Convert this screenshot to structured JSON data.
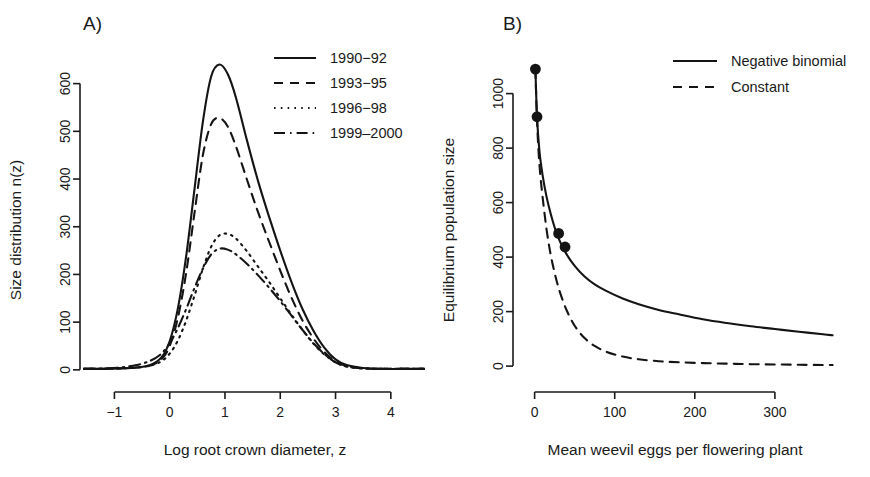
{
  "figure": {
    "background": "#ffffff",
    "line_color": "#141414",
    "panels": [
      "A)",
      "B)"
    ]
  },
  "panel_a": {
    "tag": "A)",
    "legend": {
      "position": "top-right",
      "entries": [
        {
          "label": "1990−92",
          "style": "solid"
        },
        {
          "label": "1993−95",
          "style": "dashed"
        },
        {
          "label": "1996−98",
          "style": "dotted"
        },
        {
          "label": "1999–2000",
          "style": "dashdot"
        }
      ]
    }
  },
  "panel_b": {
    "tag": "B)",
    "legend": {
      "position": "top-right",
      "entries": [
        {
          "label": "Negative binomial",
          "style": "solid"
        },
        {
          "label": "Constant",
          "style": "dashed"
        }
      ]
    }
  },
  "chart_data": [
    {
      "type": "line",
      "panel": "A)",
      "title": "",
      "xlabel": "Log root crown diameter, z",
      "ylabel": "Size distribution n(z)",
      "xlim": [
        -1.55,
        4.6
      ],
      "ylim": [
        -15,
        660
      ],
      "xticks": [
        -1,
        0,
        1,
        2,
        3,
        4
      ],
      "xticklabels": [
        "−1",
        "0",
        "1",
        "2",
        "3",
        "4"
      ],
      "yticks": [
        0,
        100,
        200,
        300,
        400,
        500,
        600
      ],
      "yticklabels": [
        "0",
        "100",
        "200",
        "300",
        "400",
        "500",
        "600"
      ],
      "grid": false,
      "legend_position": "upper right",
      "series": [
        {
          "name": "1990−92",
          "style": "solid",
          "peak_x": 0.9,
          "peak_y": 640,
          "x": [
            -1.55,
            -1.2,
            -0.9,
            -0.6,
            -0.35,
            -0.15,
            0.0,
            0.15,
            0.3,
            0.45,
            0.6,
            0.75,
            0.9,
            1.05,
            1.2,
            1.4,
            1.6,
            1.8,
            2.0,
            2.2,
            2.4,
            2.6,
            2.8,
            3.0,
            3.2,
            3.5,
            3.9,
            4.3,
            4.6
          ],
          "y": [
            2,
            2,
            3,
            5,
            10,
            26,
            60,
            130,
            240,
            380,
            520,
            615,
            640,
            620,
            570,
            480,
            395,
            320,
            250,
            185,
            128,
            82,
            46,
            22,
            10,
            4,
            2,
            2,
            2
          ]
        },
        {
          "name": "1993−95",
          "style": "dashed",
          "peak_x": 0.95,
          "peak_y": 528,
          "x": [
            -1.55,
            -1.2,
            -0.9,
            -0.6,
            -0.35,
            -0.15,
            0.0,
            0.15,
            0.3,
            0.45,
            0.6,
            0.75,
            0.9,
            1.05,
            1.2,
            1.4,
            1.6,
            1.8,
            2.0,
            2.2,
            2.4,
            2.6,
            2.8,
            3.0,
            3.2,
            3.5,
            3.9,
            4.3,
            4.6
          ],
          "y": [
            2,
            2,
            3,
            5,
            9,
            22,
            50,
            110,
            205,
            330,
            450,
            515,
            528,
            510,
            468,
            398,
            330,
            268,
            208,
            152,
            104,
            66,
            37,
            18,
            8,
            3,
            2,
            2,
            2
          ]
        },
        {
          "name": "1996−98",
          "style": "dotted",
          "peak_x": 1.0,
          "peak_y": 285,
          "x": [
            -1.55,
            -1.2,
            -0.9,
            -0.6,
            -0.35,
            -0.15,
            0.0,
            0.15,
            0.3,
            0.45,
            0.6,
            0.75,
            0.9,
            1.05,
            1.2,
            1.4,
            1.6,
            1.8,
            2.0,
            2.2,
            2.4,
            2.6,
            2.8,
            3.0,
            3.2,
            3.5,
            3.9,
            4.3,
            4.6
          ],
          "y": [
            2,
            2,
            3,
            5,
            9,
            18,
            34,
            62,
            104,
            156,
            212,
            258,
            282,
            285,
            275,
            248,
            216,
            184,
            150,
            116,
            84,
            55,
            32,
            16,
            7,
            3,
            2,
            2,
            2
          ]
        },
        {
          "name": "1999–2000",
          "style": "dashdot",
          "peak_x": 0.95,
          "peak_y": 255,
          "x": [
            -1.55,
            -1.2,
            -0.9,
            -0.6,
            -0.35,
            -0.15,
            0.0,
            0.15,
            0.3,
            0.45,
            0.6,
            0.75,
            0.9,
            1.05,
            1.2,
            1.4,
            1.6,
            1.8,
            2.0,
            2.2,
            2.4,
            2.6,
            2.8,
            3.0,
            3.2,
            3.5,
            3.9,
            4.3,
            4.6
          ],
          "y": [
            2,
            3,
            5,
            10,
            19,
            34,
            56,
            88,
            128,
            172,
            212,
            242,
            254,
            252,
            242,
            222,
            198,
            172,
            144,
            114,
            84,
            56,
            33,
            16,
            7,
            3,
            2,
            2,
            2
          ]
        }
      ]
    },
    {
      "type": "line",
      "panel": "B)",
      "title": "",
      "xlabel": "Mean weevil eggs per flowering plant",
      "ylabel": "Equilibrium population size",
      "xlim": [
        -12,
        400
      ],
      "ylim": [
        -40,
        1160
      ],
      "xticks": [
        0,
        100,
        200,
        300
      ],
      "xticklabels": [
        "0",
        "100",
        "200",
        "300"
      ],
      "yticks": [
        0,
        200,
        400,
        600,
        800,
        1000
      ],
      "yticklabels": [
        "0",
        "200",
        "400",
        "600",
        "800",
        "1000"
      ],
      "grid": false,
      "legend_position": "upper right",
      "series": [
        {
          "name": "Negative binomial",
          "style": "solid",
          "x": [
            1,
            3,
            6,
            10,
            15,
            20,
            26,
            32,
            40,
            50,
            62,
            75,
            90,
            110,
            130,
            155,
            180,
            210,
            240,
            270,
            300,
            330,
            360,
            372
          ],
          "y": [
            1090,
            915,
            790,
            700,
            620,
            560,
            500,
            455,
            410,
            368,
            330,
            300,
            275,
            248,
            227,
            206,
            190,
            172,
            158,
            146,
            136,
            126,
            117,
            113
          ]
        },
        {
          "name": "Constant",
          "style": "dashed",
          "x": [
            1,
            3,
            6,
            10,
            15,
            20,
            26,
            32,
            40,
            50,
            62,
            75,
            90,
            110,
            130,
            155,
            180,
            210,
            240,
            270,
            300,
            330,
            360,
            372
          ],
          "y": [
            1090,
            900,
            740,
            620,
            500,
            410,
            330,
            268,
            205,
            148,
            104,
            74,
            52,
            35,
            25,
            18,
            14,
            11,
            9,
            7,
            6,
            5,
            4,
            4
          ]
        }
      ],
      "points": {
        "name": "observed-equilibria",
        "x": [
          1,
          3,
          30,
          38
        ],
        "y": [
          1090,
          915,
          487,
          437
        ]
      }
    }
  ]
}
